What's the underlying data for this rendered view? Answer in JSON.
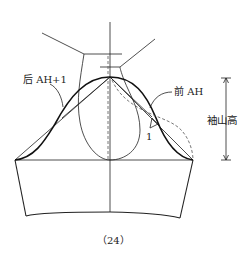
{
  "diagram": {
    "type": "sleeve-pattern-drafting",
    "labels": {
      "back_armhole": "后 AH+1",
      "front_armhole": "前 AH",
      "cap_height": "袖山高",
      "ease_mark": "1",
      "figure_number": "（24）"
    },
    "colors": {
      "line": "#222222",
      "dashed": "#555555",
      "background": "#ffffff"
    }
  }
}
